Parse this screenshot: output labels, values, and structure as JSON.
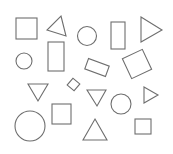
{
  "diagram": {
    "width": 173,
    "height": 154,
    "background": "#ffffff",
    "stroke_color": "#6e6e6e",
    "shapes": [
      {
        "name": "square",
        "type": "rect",
        "x": 16,
        "y": 18,
        "w": 21,
        "h": 21,
        "rotate": 0
      },
      {
        "name": "triangle-tilted",
        "type": "polygon",
        "points": "61,16 66,36 47,30"
      },
      {
        "name": "circle",
        "type": "circle",
        "cx": 87,
        "cy": 36,
        "r": 9.5
      },
      {
        "name": "tall-rectangle",
        "type": "rect",
        "x": 111,
        "y": 22,
        "w": 14,
        "h": 27,
        "rotate": 0
      },
      {
        "name": "triangle-right",
        "type": "polygon",
        "points": "141,17 162,30 141,42"
      },
      {
        "name": "small-circle",
        "type": "circle",
        "cx": 24,
        "cy": 61,
        "r": 8
      },
      {
        "name": "tall-rectangle-2",
        "type": "rect",
        "x": 48,
        "y": 42,
        "w": 16,
        "h": 29,
        "rotate": 0
      },
      {
        "name": "tilted-rectangle",
        "type": "rect",
        "x": 86,
        "y": 62,
        "w": 22,
        "h": 11,
        "rotate": 20
      },
      {
        "name": "tilted-square",
        "type": "rect",
        "x": 126,
        "y": 53,
        "w": 22,
        "h": 22,
        "rotate": -25
      },
      {
        "name": "triangle-down",
        "type": "polygon",
        "points": "28,84 48,84 38,101"
      },
      {
        "name": "small-diamond",
        "type": "rect",
        "x": 69,
        "y": 80,
        "w": 9,
        "h": 9,
        "rotate": 40
      },
      {
        "name": "triangle-down-2",
        "type": "polygon",
        "points": "87,90 106,90 97,106"
      },
      {
        "name": "circle-2",
        "type": "circle",
        "cx": 121,
        "cy": 104,
        "r": 10
      },
      {
        "name": "triangle-right-small",
        "type": "polygon",
        "points": "144,87 158,95 144,103"
      },
      {
        "name": "big-circle",
        "type": "circle",
        "cx": 30,
        "cy": 126,
        "r": 15
      },
      {
        "name": "square-2",
        "type": "rect",
        "x": 52,
        "y": 104,
        "w": 19,
        "h": 20,
        "rotate": 0
      },
      {
        "name": "triangle-up",
        "type": "polygon",
        "points": "95,119 107,140 83,140"
      },
      {
        "name": "small-square",
        "type": "rect",
        "x": 135,
        "y": 119,
        "w": 16,
        "h": 15,
        "rotate": 0
      }
    ]
  }
}
